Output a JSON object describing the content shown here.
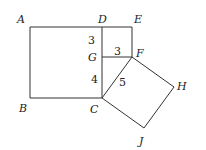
{
  "diagram": {
    "title": "",
    "vertices": {
      "A": {
        "label": "A",
        "x": 30,
        "y": 27
      },
      "B": {
        "label": "B",
        "x": 30,
        "y": 98
      },
      "C": {
        "label": "C",
        "x": 102,
        "y": 98
      },
      "D": {
        "label": "D",
        "x": 102,
        "y": 27
      },
      "E": {
        "label": "E",
        "x": 132,
        "y": 27
      },
      "F": {
        "label": "F",
        "x": 132,
        "y": 57
      },
      "G": {
        "label": "G",
        "x": 102,
        "y": 57
      },
      "H": {
        "label": "H",
        "x": 174,
        "y": 87
      },
      "J": {
        "label": "J",
        "x": 144,
        "y": 128
      }
    },
    "lengths": {
      "DG": "3",
      "GF": "3",
      "GC": "4",
      "CF": "5"
    },
    "shapes": [
      {
        "name": "square ABCD",
        "points": "A-B-C-D"
      },
      {
        "name": "square DEFG",
        "points": "D-E-F-G"
      },
      {
        "name": "square CFHJ",
        "points": "C-F-H-J"
      },
      {
        "name": "triangle CGF",
        "points": "C-G-F"
      }
    ],
    "colors": {
      "stroke": "#333333",
      "text": "#222222",
      "background": "#ffffff"
    }
  }
}
